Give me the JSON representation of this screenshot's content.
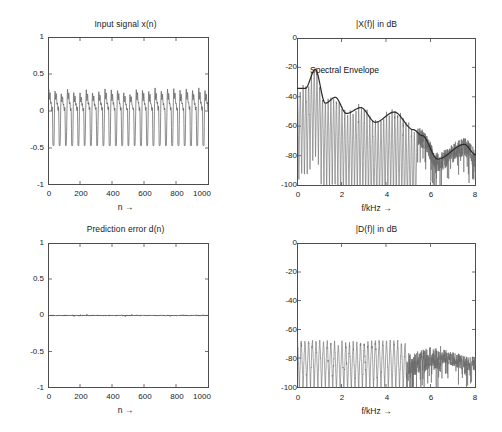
{
  "figure": {
    "background": "#ffffff",
    "axis_color": "#4d4d4d",
    "line_color": "#5a5a5a",
    "envelope_color": "#2b2b2b"
  },
  "chart_data": [
    {
      "type": "line",
      "panel": "top-left",
      "title": "Input signal x(n)",
      "xlabel": "n →",
      "ylabel": "",
      "xlim": [
        0,
        1024
      ],
      "ylim": [
        -1,
        1
      ],
      "xticks": [
        0,
        200,
        400,
        600,
        800,
        1000
      ],
      "xticklabels": [
        "0",
        "200",
        "400",
        "600",
        "800",
        "1000"
      ],
      "yticks": [
        -1,
        -0.5,
        0,
        0.5,
        1
      ],
      "yticklabels": [
        "-1",
        "-0.5",
        "0",
        "0.5",
        "1"
      ],
      "grid": false,
      "legend": null,
      "series": [
        {
          "name": "x(n)",
          "description": "quasi-periodic speech-like waveform, pitch period ~40 samples, amplitude approx -0.45 to +0.33",
          "peak_positive": 0.33,
          "peak_negative": -0.45,
          "n_points": 1024
        }
      ]
    },
    {
      "type": "line",
      "panel": "top-right",
      "title": "|X(f)| in dB",
      "xlabel": "f/kHz →",
      "ylabel": "",
      "xlim": [
        0,
        8
      ],
      "ylim": [
        -100,
        0
      ],
      "xticks": [
        0,
        2,
        4,
        6,
        8
      ],
      "xticklabels": [
        "0",
        "2",
        "4",
        "6",
        "8"
      ],
      "yticks": [
        -100,
        -80,
        -60,
        -40,
        -20,
        0
      ],
      "yticklabels": [
        "-100",
        "-80",
        "-60",
        "-40",
        "-20",
        "0"
      ],
      "grid": false,
      "annotations": [
        {
          "text": "Spectral Envelope",
          "x": 1.1,
          "y": -24
        }
      ],
      "series": [
        {
          "name": "|X(f)| spectrum",
          "description": "harmonic line spectrum with deep nulls, peaks decaying from -20 dB near 0.8 kHz to -85 dB near 6.5 kHz"
        },
        {
          "name": "Spectral Envelope",
          "description": "smooth LPC envelope through the formant peaks",
          "formant_points_khz": [
            0.0,
            0.35,
            0.8,
            1.25,
            1.7,
            2.2,
            2.85,
            3.5,
            4.35,
            5.2,
            5.6,
            6.3,
            7.5,
            8.0
          ],
          "formant_levels_db": [
            -34,
            -34,
            -21,
            -44,
            -40,
            -51,
            -47,
            -57,
            -50,
            -62,
            -66,
            -82,
            -72,
            -79
          ]
        }
      ]
    },
    {
      "type": "line",
      "panel": "bottom-left",
      "title": "Prediction error d(n)",
      "xlabel": "n →",
      "ylabel": "",
      "xlim": [
        0,
        1024
      ],
      "ylim": [
        -1,
        1
      ],
      "xticks": [
        0,
        200,
        400,
        600,
        800,
        1000
      ],
      "xticklabels": [
        "0",
        "200",
        "400",
        "600",
        "800",
        "1000"
      ],
      "yticks": [
        -1,
        -0.5,
        0,
        0.5,
        1
      ],
      "yticklabels": [
        "-1",
        "-0.5",
        "0",
        "0.5",
        "1"
      ],
      "grid": false,
      "legend": null,
      "series": [
        {
          "name": "d(n)",
          "description": "near-zero residual, visually a flat line at 0 with tiny fluctuations",
          "peak_positive": 0.012,
          "peak_negative": -0.012,
          "n_points": 1024
        }
      ]
    },
    {
      "type": "line",
      "panel": "bottom-right",
      "title": "|D(f)| in dB",
      "xlabel": "f/kHz →",
      "ylabel": "",
      "xlim": [
        0,
        8
      ],
      "ylim": [
        -100,
        0
      ],
      "xticks": [
        0,
        2,
        4,
        6,
        8
      ],
      "xticklabels": [
        "0",
        "2",
        "4",
        "6",
        "8"
      ],
      "yticks": [
        -100,
        -80,
        -60,
        -40,
        -20,
        0
      ],
      "yticklabels": [
        "-100",
        "-80",
        "-60",
        "-40",
        "-20",
        "0"
      ],
      "grid": false,
      "series": [
        {
          "name": "|D(f)| spectrum",
          "description": "flattened residual spectrum, harmonic spikes between -68 dB and -100 dB across the whole band"
        }
      ]
    }
  ]
}
